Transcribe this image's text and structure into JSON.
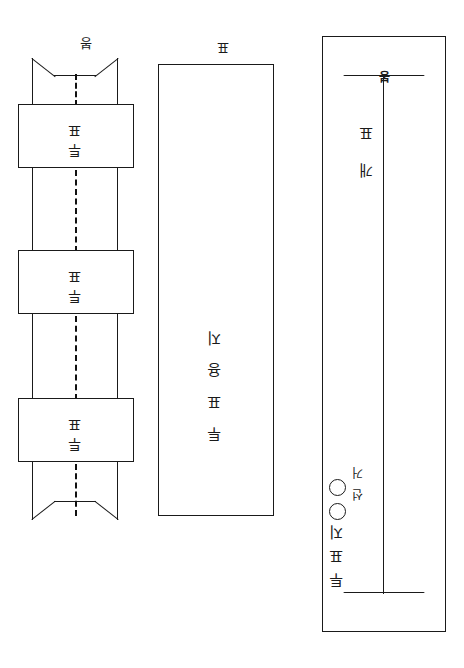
{
  "document": {
    "kind": "scanned-line-drawing",
    "orientation": "upside-down",
    "page_background": "#ffffff",
    "ink_color": "#1a1a1a"
  },
  "figures": {
    "envelope": {
      "name": "envelope-diagram",
      "main_text": "투표지",
      "side_text": "선거",
      "circle_count": 2,
      "circle_labels": [
        "○",
        "○"
      ],
      "bottom_text": "개표",
      "seal_mark": "봉",
      "caption": ""
    },
    "ballot": {
      "name": "ballot-diagram",
      "text_upper": "투표인",
      "text_lower": "투표용지",
      "caption": "표"
    },
    "strip": {
      "name": "sealed-strip-diagram",
      "bands": [
        {
          "text": "투표"
        },
        {
          "text": "투표"
        },
        {
          "text": "투표"
        }
      ],
      "caption": "봉"
    }
  }
}
